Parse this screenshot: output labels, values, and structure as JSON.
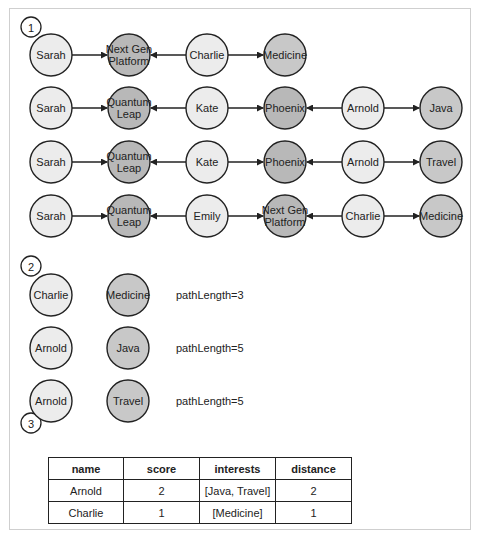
{
  "section_markers": [
    "1",
    "2",
    "3"
  ],
  "colors": {
    "person_fill": "#ececec",
    "project_fill": "#b8b8b8",
    "interest_fill": "#c8c8c8",
    "stroke": "#222222",
    "frame": "#cfcfcf"
  },
  "paths": [
    {
      "nodes": [
        "Sarah",
        "Next Gen Platform",
        "Charlie",
        "Medicine"
      ]
    },
    {
      "nodes": [
        "Sarah",
        "Quantum Leap",
        "Kate",
        "Phoenix",
        "Arnold",
        "Java"
      ]
    },
    {
      "nodes": [
        "Sarah",
        "Quantum Leap",
        "Kate",
        "Phoenix",
        "Arnold",
        "Travel"
      ]
    },
    {
      "nodes": [
        "Sarah",
        "Quantum Leap",
        "Emily",
        "Next Gen Platform",
        "Charlie",
        "Medicine"
      ]
    }
  ],
  "pairs": [
    {
      "person": "Charlie",
      "interest": "Medicine",
      "label": "pathLength=3"
    },
    {
      "person": "Arnold",
      "interest": "Java",
      "label": "pathLength=5"
    },
    {
      "person": "Arnold",
      "interest": "Travel",
      "label": "pathLength=5"
    }
  ],
  "table": {
    "headers": [
      "name",
      "score",
      "interests",
      "distance"
    ],
    "rows": [
      [
        "Arnold",
        "2",
        "[Java, Travel]",
        "2"
      ],
      [
        "Charlie",
        "1",
        "[Medicine]",
        "1"
      ]
    ]
  }
}
